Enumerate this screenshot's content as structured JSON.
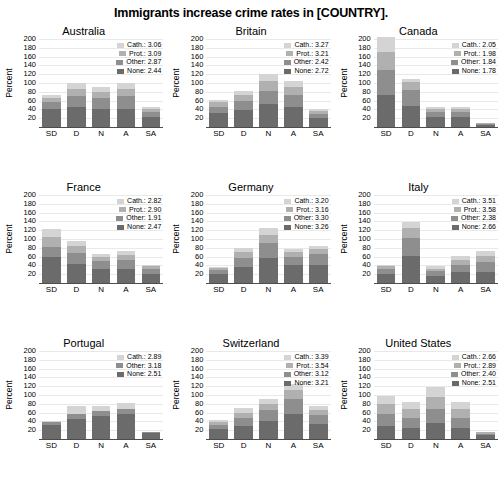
{
  "chart_data": {
    "type": "bar",
    "title": "Immigrants increase crime rates in [COUNTRY].",
    "xlabel": "",
    "ylabel": "Percent",
    "ylim": [
      0,
      200
    ],
    "yticks": [
      20,
      40,
      60,
      80,
      100,
      120,
      140,
      160,
      180,
      200
    ],
    "categories": [
      "SD",
      "D",
      "N",
      "A",
      "SA"
    ],
    "stacked": true,
    "grid": true,
    "legend_position": "top-right inside each panel",
    "series_order": [
      "Cath.",
      "Prot.",
      "Other",
      "None"
    ],
    "series_colors": {
      "Cath.": "#d4d4d4",
      "Prot.": "#b0b0b0",
      "Other": "#8e8e8e",
      "None": "#6b6b6b"
    },
    "panels": [
      {
        "name": "Australia",
        "legend": [
          {
            "label": "Cath.: 3.06",
            "key": "Cath.",
            "value": 3.06
          },
          {
            "label": "Prot.: 3.09",
            "key": "Prot.",
            "value": 3.09
          },
          {
            "label": "Other: 2.87",
            "key": "Other",
            "value": 2.87
          },
          {
            "label": "None: 2.44",
            "key": "None",
            "value": 2.44
          }
        ],
        "series": [
          {
            "name": "None",
            "values": [
              40,
              45,
              40,
              42,
              22
            ]
          },
          {
            "name": "Other",
            "values": [
              18,
              25,
              26,
              28,
              13
            ]
          },
          {
            "name": "Prot.",
            "values": [
              9,
              16,
              14,
              17,
              6
            ]
          },
          {
            "name": "Cath.",
            "values": [
              5,
              14,
              12,
              13,
              4
            ]
          }
        ],
        "totals": [
          72,
          100,
          92,
          100,
          45
        ]
      },
      {
        "name": "Britain",
        "legend": [
          {
            "label": "Cath.: 3.27",
            "key": "Cath.",
            "value": 3.27
          },
          {
            "label": "Prot.: 3.21",
            "key": "Prot.",
            "value": 3.21
          },
          {
            "label": "Other: 2.42",
            "key": "Other",
            "value": 2.42
          },
          {
            "label": "None: 2.72",
            "key": "None",
            "value": 2.72
          }
        ],
        "series": [
          {
            "name": "None",
            "values": [
              32,
              38,
              52,
              46,
              20
            ]
          },
          {
            "name": "Other",
            "values": [
              14,
              20,
              30,
              26,
              10
            ]
          },
          {
            "name": "Prot.",
            "values": [
              10,
              14,
              22,
              18,
              7
            ]
          },
          {
            "name": "Cath.",
            "values": [
              6,
              10,
              16,
              14,
              5
            ]
          }
        ],
        "totals": [
          62,
          82,
          120,
          104,
          42
        ]
      },
      {
        "name": "Canada",
        "legend": [
          {
            "label": "Cath.: 2.05",
            "key": "Cath.",
            "value": 2.05
          },
          {
            "label": "Prot.: 1.98",
            "key": "Prot.",
            "value": 1.98
          },
          {
            "label": "Other: 1.84",
            "key": "Other",
            "value": 1.84
          },
          {
            "label": "None: 1.78",
            "key": "None",
            "value": 1.78
          }
        ],
        "series": [
          {
            "name": "None",
            "values": [
              72,
              48,
              22,
              22,
              5
            ]
          },
          {
            "name": "Other",
            "values": [
              58,
              36,
              12,
              13,
              3
            ]
          },
          {
            "name": "Prot.",
            "values": [
              40,
              18,
              7,
              6,
              1
            ]
          },
          {
            "name": "Cath.",
            "values": [
              35,
              8,
              4,
              4,
              1
            ]
          }
        ],
        "totals": [
          205,
          110,
          45,
          45,
          10
        ]
      },
      {
        "name": "France",
        "legend": [
          {
            "label": "Cath.: 2.82",
            "key": "Cath.",
            "value": 2.82
          },
          {
            "label": "Prot.: 2.90",
            "key": "Prot.",
            "value": 2.9
          },
          {
            "label": "Other: 1.91",
            "key": "Other",
            "value": 1.91
          },
          {
            "label": "None: 2.47",
            "key": "None",
            "value": 2.47
          }
        ],
        "series": [
          {
            "name": "None",
            "values": [
              58,
              44,
              32,
              32,
              20
            ]
          },
          {
            "name": "Other",
            "values": [
              24,
              24,
              18,
              20,
              11
            ]
          },
          {
            "name": "Prot.",
            "values": [
              22,
              16,
              9,
              12,
              7
            ]
          },
          {
            "name": "Cath.",
            "values": [
              18,
              11,
              6,
              8,
              4
            ]
          }
        ],
        "totals": [
          122,
          95,
          65,
          72,
          42
        ]
      },
      {
        "name": "Germany",
        "legend": [
          {
            "label": "Cath.: 3.20",
            "key": "Cath.",
            "value": 3.2
          },
          {
            "label": "Prot.: 3.16",
            "key": "Prot.",
            "value": 3.16
          },
          {
            "label": "Other: 3.30",
            "key": "Other",
            "value": 3.3
          },
          {
            "label": "None: 3.26",
            "key": "None",
            "value": 3.26
          }
        ],
        "series": [
          {
            "name": "None",
            "values": [
              20,
              36,
              56,
              40,
              42
            ]
          },
          {
            "name": "Other",
            "values": [
              9,
              22,
              34,
              20,
              23
            ]
          },
          {
            "name": "Prot.",
            "values": [
              5,
              13,
              20,
              11,
              12
            ]
          },
          {
            "name": "Cath.",
            "values": [
              3,
              9,
              15,
              7,
              8
            ]
          }
        ],
        "totals": [
          37,
          80,
          125,
          78,
          85
        ]
      },
      {
        "name": "Italy",
        "legend": [
          {
            "label": "Cath.: 3.51",
            "key": "Cath.",
            "value": 3.51
          },
          {
            "label": "Prot.: 3.58",
            "key": "Prot.",
            "value": 3.58
          },
          {
            "label": "Other: 2.38",
            "key": "Other",
            "value": 2.38
          },
          {
            "label": "None: 2.66",
            "key": "None",
            "value": 2.66
          }
        ],
        "series": [
          {
            "name": "None",
            "values": [
              20,
              62,
              16,
              24,
              26
            ]
          },
          {
            "name": "Other",
            "values": [
              12,
              40,
              11,
              18,
              22
            ]
          },
          {
            "name": "Prot.",
            "values": [
              6,
              22,
              6,
              11,
              14
            ]
          },
          {
            "name": "Cath.",
            "values": [
              4,
              14,
              5,
              9,
              10
            ]
          }
        ],
        "totals": [
          42,
          138,
          38,
          62,
          72
        ]
      },
      {
        "name": "Portugal",
        "legend": [
          {
            "label": "Cath.: 2.89",
            "key": "Cath.",
            "value": 2.89
          },
          {
            "label": "Other: 3.18",
            "key": "Other",
            "value": 3.18
          },
          {
            "label": "None: 2.51",
            "key": "None",
            "value": 2.51
          }
        ],
        "series": [
          {
            "name": "None",
            "values": [
              32,
              45,
              52,
              57,
              14
            ]
          },
          {
            "name": "Other",
            "values": [
              6,
              12,
              11,
              12,
              2
            ]
          },
          {
            "name": "Cath.",
            "values": [
              2,
              19,
              13,
              13,
              1
            ]
          }
        ],
        "totals": [
          40,
          76,
          76,
          82,
          17
        ]
      },
      {
        "name": "Switzerland",
        "legend": [
          {
            "label": "Cath.: 3.39",
            "key": "Cath.",
            "value": 3.39
          },
          {
            "label": "Prot.: 3.54",
            "key": "Prot.",
            "value": 3.54
          },
          {
            "label": "Other: 3.12",
            "key": "Other",
            "value": 3.12
          },
          {
            "label": "None: 3.21",
            "key": "None",
            "value": 3.21
          }
        ],
        "series": [
          {
            "name": "None",
            "values": [
              22,
              30,
              40,
              56,
              34
            ]
          },
          {
            "name": "Other",
            "values": [
              10,
              18,
              26,
              36,
              20
            ]
          },
          {
            "name": "Prot.",
            "values": [
              7,
              12,
              14,
              20,
              13
            ]
          },
          {
            "name": "Cath.",
            "values": [
              5,
              10,
              10,
              14,
              9
            ]
          }
        ],
        "totals": [
          44,
          70,
          90,
          126,
          76
        ]
      },
      {
        "name": "United States",
        "legend": [
          {
            "label": "Cath.: 2.66",
            "key": "Cath.",
            "value": 2.66
          },
          {
            "label": "Prot.: 2.89",
            "key": "Prot.",
            "value": 2.89
          },
          {
            "label": "Other: 2.40",
            "key": "Other",
            "value": 2.4
          },
          {
            "label": "None: 2.51",
            "key": "None",
            "value": 2.51
          }
        ],
        "series": [
          {
            "name": "None",
            "values": [
              30,
              26,
              36,
              26,
              8
            ]
          },
          {
            "name": "Other",
            "values": [
              28,
              22,
              32,
              22,
              4
            ]
          },
          {
            "name": "Prot.",
            "values": [
              22,
              20,
              28,
              20,
              3
            ]
          },
          {
            "name": "Cath.",
            "values": [
              18,
              16,
              22,
              16,
              2
            ]
          }
        ],
        "totals": [
          98,
          84,
          118,
          84,
          17
        ]
      }
    ]
  }
}
